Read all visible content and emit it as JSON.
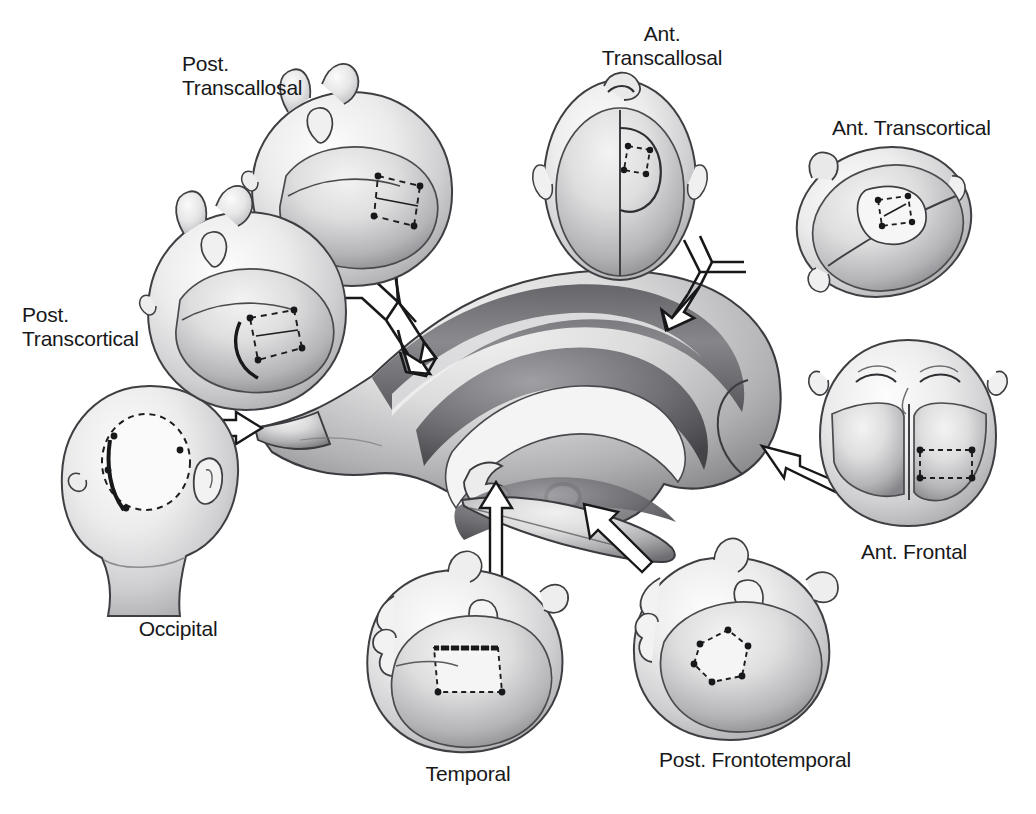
{
  "figure": {
    "background_color": "#ffffff",
    "ink_color": "#17181a",
    "width": 1036,
    "height": 814
  },
  "center": {
    "name": "lateral-ventricle",
    "description": "Central sagittal cutaway of the lateral ventricle with caudate, thalamus and choroid plexus"
  },
  "approaches": [
    {
      "id": "post-transcallosal",
      "label": "Post.\nTranscallosal",
      "align": "left",
      "label_x": 182,
      "label_y": 52,
      "view": "lateral-head-superior-posterior",
      "head_cx": 352,
      "head_cy": 188,
      "head_r": 96,
      "flap": "dashed-rectangle-with-four-burr-holes"
    },
    {
      "id": "ant-transcallosal",
      "label": "Ant.\nTranscallosal",
      "align": "center",
      "label_x": 662,
      "label_y": 22,
      "view": "vertex-top-down",
      "head_cx": 620,
      "head_cy": 172,
      "head_r": 88,
      "flap": "dashed-rectangle-with-four-burr-holes"
    },
    {
      "id": "ant-transcortical",
      "label": "Ant. Transcortical",
      "align": "left",
      "label_x": 832,
      "label_y": 116,
      "view": "vertex-oblique",
      "head_cx": 884,
      "head_cy": 218,
      "head_r": 86,
      "flap": "dashed-rectangle-with-four-burr-holes"
    },
    {
      "id": "ant-frontal",
      "label": "Ant. Frontal",
      "align": "center",
      "label_x": 914,
      "label_y": 540,
      "view": "frontal-face-on",
      "head_cx": 908,
      "head_cy": 432,
      "head_r": 86,
      "flap": "dashed-rectangle-with-four-burr-holes"
    },
    {
      "id": "post-frontotemporal",
      "label": "Post. Frontotemporal",
      "align": "center",
      "label_x": 755,
      "label_y": 748,
      "view": "lateral-head-anterior",
      "head_cx": 735,
      "head_cy": 650,
      "head_r": 92,
      "flap": "dashed-rectangle-with-four-burr-holes"
    },
    {
      "id": "temporal",
      "label": "Temporal",
      "align": "center",
      "label_x": 468,
      "label_y": 762,
      "view": "lateral-head-temporal",
      "head_cx": 462,
      "head_cy": 662,
      "head_r": 94,
      "flap": "dashed-rectangle-with-four-burr-holes"
    },
    {
      "id": "occipital",
      "label": "Occipital",
      "align": "center",
      "label_x": 178,
      "label_y": 617,
      "view": "posterior-occiput",
      "head_cx": 148,
      "head_cy": 474,
      "head_r": 88,
      "flap": "dashed-circle-with-burr-holes"
    },
    {
      "id": "post-transcortical",
      "label": "Post.\nTranscortical",
      "align": "left",
      "label_x": 22,
      "label_y": 303,
      "view": "lateral-head-posterior",
      "head_cx": 246,
      "head_cy": 310,
      "head_r": 98,
      "flap": "dashed-rectangle-with-four-burr-holes"
    }
  ],
  "arrows": [
    {
      "id": "arrow-y-left",
      "shape": "y-bifurcated-outline-arrow",
      "from": [
        "post-transcallosal",
        "post-transcortical"
      ],
      "to": "lateral-ventricle-body",
      "direction": "down-right"
    },
    {
      "id": "arrow-y-right",
      "shape": "y-bifurcated-outline-arrow",
      "from": [
        "ant-transcallosal",
        "ant-transcortical"
      ],
      "to": "lateral-ventricle-body",
      "direction": "down-left"
    },
    {
      "id": "arrow-occipital",
      "shape": "straight-outline-arrow",
      "from": "occipital",
      "to": "occipital-horn",
      "direction": "right"
    },
    {
      "id": "arrow-ant-frontal",
      "shape": "straight-outline-arrow",
      "from": "ant-frontal",
      "to": "frontal-horn",
      "direction": "left"
    },
    {
      "id": "arrow-temporal",
      "shape": "straight-outline-arrow",
      "from": "temporal",
      "to": "temporal-horn",
      "direction": "up"
    },
    {
      "id": "arrow-post-frontotemporal",
      "shape": "straight-outline-arrow",
      "from": "post-frontotemporal",
      "to": "atrium",
      "direction": "up-left"
    }
  ]
}
